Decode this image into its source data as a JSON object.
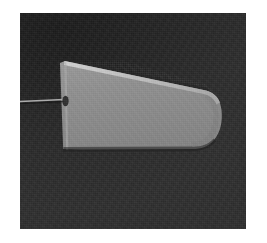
{
  "figure": {
    "kind": "grayscale-micrograph",
    "page_background": "#ffffff",
    "field": {
      "label": "imaging field",
      "background_color": "#2f2f2f",
      "x": 20,
      "y": 13,
      "width": 226,
      "height": 216,
      "texture": "fine speckle noise"
    },
    "specimen": {
      "label": "specimen",
      "description": "bright rounded-end slab, tilted",
      "fill_color": "#8e8e8e",
      "edge_highlight_color": "#c2c2c2",
      "edge_shadow_color": "#3a3a3a",
      "outline_points": "45,48 185,78 199,90 201,115 190,135 105,133 44,135 40,50",
      "rounded_end": "right",
      "tilt": "slightly clockwise"
    },
    "probe_line": {
      "label": "probe filament",
      "color": "#b5b5b5",
      "x1": 0,
      "y1": 88,
      "x2": 44,
      "y2": 86,
      "thickness": 1
    },
    "edge_defect": {
      "label": "edge notch",
      "color": "#2b2b2b",
      "cx": 45,
      "cy": 88,
      "rx": 3,
      "ry": 5
    }
  },
  "annotations": {
    "title": "",
    "scale_bar": "",
    "caption": ""
  }
}
